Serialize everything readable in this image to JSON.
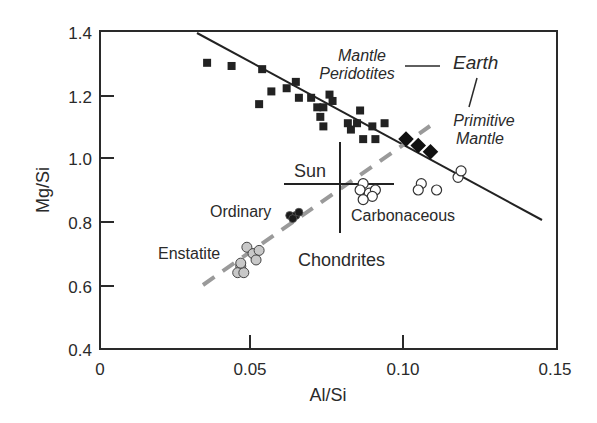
{
  "chart_data": {
    "type": "scatter",
    "title": "",
    "xlabel": "Al/Si",
    "ylabel": "Mg/Si",
    "xlim": [
      0,
      0.15
    ],
    "ylim": [
      0.4,
      1.4
    ],
    "grid": false,
    "legend": null,
    "x_ticks": [
      "0",
      "0.05",
      "0.10",
      "0.15"
    ],
    "y_ticks": [
      "0.4",
      "0.6",
      "0.8",
      "1.0",
      "1.2",
      "1.4"
    ],
    "series": [
      {
        "name": "Mantle Peridotites",
        "marker": "filled-square",
        "color": "#222222",
        "points": [
          [
            0.035,
            1.3
          ],
          [
            0.043,
            1.29
          ],
          [
            0.053,
            1.28
          ],
          [
            0.056,
            1.21
          ],
          [
            0.052,
            1.17
          ],
          [
            0.061,
            1.22
          ],
          [
            0.064,
            1.24
          ],
          [
            0.065,
            1.19
          ],
          [
            0.069,
            1.19
          ],
          [
            0.071,
            1.16
          ],
          [
            0.073,
            1.16
          ],
          [
            0.072,
            1.13
          ],
          [
            0.073,
            1.1
          ],
          [
            0.075,
            1.2
          ],
          [
            0.076,
            1.18
          ],
          [
            0.085,
            1.15
          ],
          [
            0.081,
            1.11
          ],
          [
            0.084,
            1.11
          ],
          [
            0.082,
            1.09
          ],
          [
            0.089,
            1.1
          ],
          [
            0.093,
            1.11
          ],
          [
            0.086,
            1.06
          ],
          [
            0.09,
            1.06
          ]
        ]
      },
      {
        "name": "Primitive Mantle (Earth)",
        "marker": "filled-diamond",
        "color": "#111111",
        "points": [
          [
            0.1,
            1.06
          ],
          [
            0.104,
            1.04
          ],
          [
            0.108,
            1.02
          ]
        ]
      },
      {
        "name": "Carbonaceous Chondrites",
        "marker": "open-circle",
        "color": "#ffffff",
        "points": [
          [
            0.086,
            0.92
          ],
          [
            0.085,
            0.9
          ],
          [
            0.088,
            0.89
          ],
          [
            0.09,
            0.9
          ],
          [
            0.089,
            0.88
          ],
          [
            0.086,
            0.87
          ],
          [
            0.105,
            0.92
          ],
          [
            0.104,
            0.9
          ],
          [
            0.11,
            0.9
          ],
          [
            0.117,
            0.94
          ],
          [
            0.118,
            0.96
          ]
        ]
      },
      {
        "name": "Ordinary Chondrites",
        "marker": "filled-circle",
        "color": "#1a1a1a",
        "points": [
          [
            0.062,
            0.82
          ],
          [
            0.064,
            0.82
          ],
          [
            0.063,
            0.81
          ],
          [
            0.065,
            0.83
          ]
        ]
      },
      {
        "name": "Enstatite Chondrites",
        "marker": "gray-circle",
        "color": "#c8c8c8",
        "points": [
          [
            0.048,
            0.72
          ],
          [
            0.05,
            0.7
          ],
          [
            0.052,
            0.71
          ],
          [
            0.051,
            0.68
          ],
          [
            0.046,
            0.66
          ],
          [
            0.045,
            0.64
          ],
          [
            0.047,
            0.64
          ],
          [
            0.046,
            0.67
          ]
        ]
      }
    ],
    "lines": [
      {
        "name": "Mantle trend",
        "style": "solid",
        "color": "#222222",
        "from": [
          0.032,
          1.4
        ],
        "to": [
          0.145,
          0.8
        ]
      },
      {
        "name": "Chondrite trend",
        "style": "dashed",
        "color": "#9a9a9a",
        "from": [
          0.034,
          0.6
        ],
        "to": [
          0.108,
          1.1
        ]
      }
    ],
    "sun": {
      "label": "Sun",
      "x": 0.078,
      "y": 0.92,
      "x_range": [
        0.06,
        0.096
      ],
      "y_range": [
        0.78,
        1.06
      ]
    },
    "annotations": [
      {
        "text": "Mantle",
        "style": "italic"
      },
      {
        "text": "Peridotites",
        "style": "italic"
      },
      {
        "text": "Earth",
        "style": "italic"
      },
      {
        "text": "Primitive",
        "style": "italic"
      },
      {
        "text": "Mantle",
        "style": "italic"
      },
      {
        "text": "Sun",
        "style": "normal"
      },
      {
        "text": "Ordinary",
        "style": "normal"
      },
      {
        "text": "Carbonaceous",
        "style": "normal"
      },
      {
        "text": "Enstatite",
        "style": "normal"
      },
      {
        "text": "Chondrites",
        "style": "normal"
      }
    ]
  }
}
